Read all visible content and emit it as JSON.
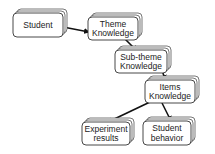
{
  "diagram": {
    "nodes": [
      {
        "id": "student",
        "lines": [
          "Student"
        ]
      },
      {
        "id": "theme",
        "lines": [
          "Theme",
          "Knowledge"
        ]
      },
      {
        "id": "subtheme",
        "lines": [
          "Sub-theme",
          "Knowledge"
        ]
      },
      {
        "id": "items",
        "lines": [
          "Items",
          "Knowledge"
        ]
      },
      {
        "id": "experiment",
        "lines": [
          "Experiment",
          "results"
        ]
      },
      {
        "id": "behavior",
        "lines": [
          "Student",
          "behavior"
        ]
      }
    ],
    "edges": [
      {
        "from": "student",
        "to": "theme"
      },
      {
        "from": "theme",
        "to": "subtheme"
      },
      {
        "from": "subtheme",
        "to": "items"
      },
      {
        "from": "items",
        "to": "experiment"
      },
      {
        "from": "items",
        "to": "behavior"
      }
    ]
  }
}
